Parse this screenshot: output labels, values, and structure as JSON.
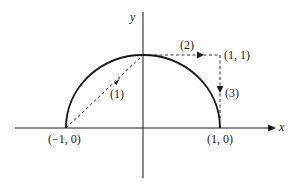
{
  "diagram": {
    "axes": {
      "x_label": "x",
      "y_label": "y"
    },
    "points": {
      "left": "(−1, 0)",
      "right": "(1, 0)",
      "corner": "(1, 1)"
    },
    "paths": [
      {
        "id": "1",
        "label": "(1)",
        "from": "(-1,0)",
        "to": "(0,1)",
        "style": "dashed"
      },
      {
        "id": "2",
        "label": "(2)",
        "from": "(0,1)",
        "to": "(1,1)",
        "style": "dashed"
      },
      {
        "id": "3",
        "label": "(3)",
        "from": "(1,1)",
        "to": "(1,0)",
        "style": "dashed"
      }
    ],
    "curve": {
      "type": "upper semicircle",
      "center": "(0,0)",
      "radius": 1,
      "style": "solid"
    },
    "colors": {
      "ink": "#1a1a1a",
      "background": "#ffffff"
    }
  }
}
